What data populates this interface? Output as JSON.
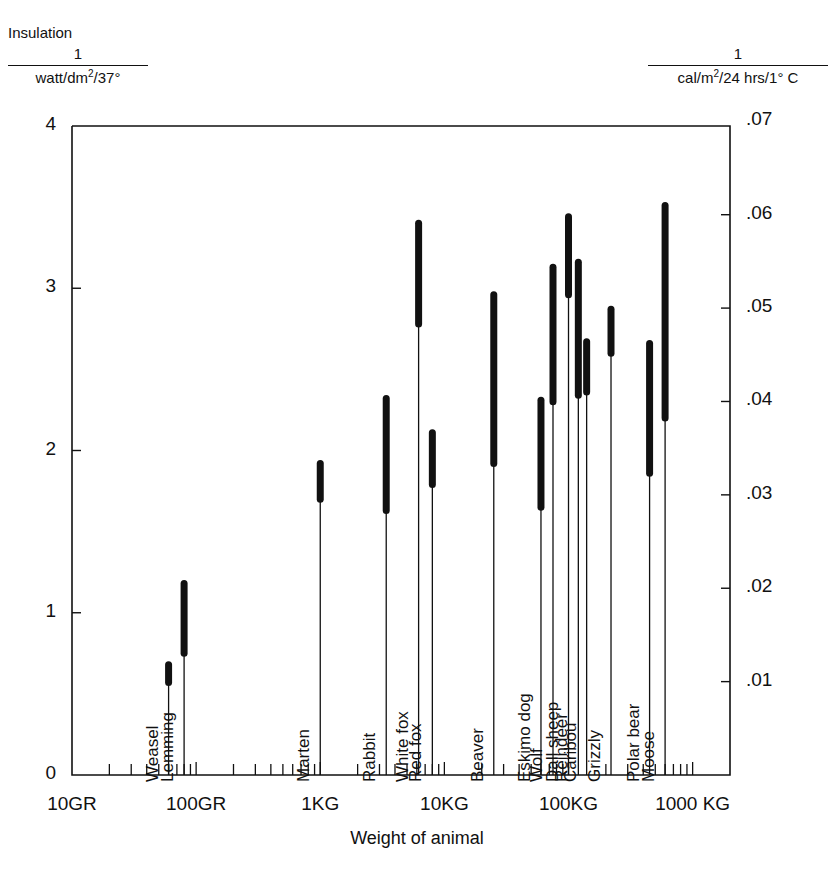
{
  "labels": {
    "insulation": "Insulation",
    "left_unit_num": "1",
    "left_unit_den": "watt/dm2/37°",
    "right_unit_num": "1",
    "right_unit_den": "cal/m2/24 hrs/1° C",
    "xaxis_title": "Weight of animal"
  },
  "chart_data": {
    "type": "bar",
    "xlabel": "Weight of animal",
    "ylabel": "Insulation  1/(watt/dm2/37°)",
    "ylabel_right": "1/(cal/m2/24 hrs/1° C)",
    "xscale": "log",
    "xlim_grams": [
      10,
      2000
    ],
    "ylim": [
      0,
      4
    ],
    "ylim_right": [
      0,
      0.0695
    ],
    "grid": false,
    "legend": null,
    "yticks": [
      "0",
      "1",
      "2",
      "3",
      "4"
    ],
    "ytick_values": [
      0,
      1,
      2,
      3,
      4
    ],
    "yticks_right": [
      ".01",
      ".02",
      ".03",
      ".04",
      ".05",
      ".06",
      ".07"
    ],
    "ytick_right_values": [
      0.01,
      0.02,
      0.03,
      0.04,
      0.05,
      0.06,
      0.07
    ],
    "xticks": [
      "10GR",
      "100GR",
      "1KG",
      "10KG",
      "100KG",
      "1000 KG"
    ],
    "xtick_values": [
      10,
      100,
      1000,
      10000,
      100000,
      1000000
    ],
    "series_note": "Each animal is a vertical line from 0 (axis) to its maximum insulation; the thick segment spans the summer-to-winter insulation range.",
    "points": [
      {
        "name": "Weasel",
        "weight_g": 60,
        "low": 0.57,
        "high": 0.68
      },
      {
        "name": "Lemming",
        "weight_g": 80,
        "low": 0.75,
        "high": 1.18
      },
      {
        "name": "Marten",
        "weight_g": 1000,
        "low": 1.7,
        "high": 1.92
      },
      {
        "name": "Rabbit",
        "weight_g": 3400,
        "low": 1.63,
        "high": 2.32
      },
      {
        "name": "White fox",
        "weight_g": 6200,
        "low": 2.78,
        "high": 3.4
      },
      {
        "name": "Red fox",
        "weight_g": 8000,
        "low": 1.79,
        "high": 2.11
      },
      {
        "name": "Beaver",
        "weight_g": 25000,
        "low": 1.92,
        "high": 2.96
      },
      {
        "name": "Eskimo dog",
        "weight_g": 60000,
        "low": 1.65,
        "high": 2.31
      },
      {
        "name": "Wolf",
        "weight_g": 75000,
        "low": 2.3,
        "high": 3.13
      },
      {
        "name": "Dall sheep",
        "weight_g": 100000,
        "low": 2.96,
        "high": 3.44
      },
      {
        "name": "Reindeer",
        "weight_g": 120000,
        "low": 2.34,
        "high": 3.16
      },
      {
        "name": "Caribou",
        "weight_g": 140000,
        "low": 2.36,
        "high": 2.67
      },
      {
        "name": "Grizzly",
        "weight_g": 220000,
        "low": 2.6,
        "high": 2.87
      },
      {
        "name": "Polar bear",
        "weight_g": 450000,
        "low": 1.86,
        "high": 2.66
      },
      {
        "name": "Moose",
        "weight_g": 600000,
        "low": 2.2,
        "high": 3.51
      }
    ]
  }
}
